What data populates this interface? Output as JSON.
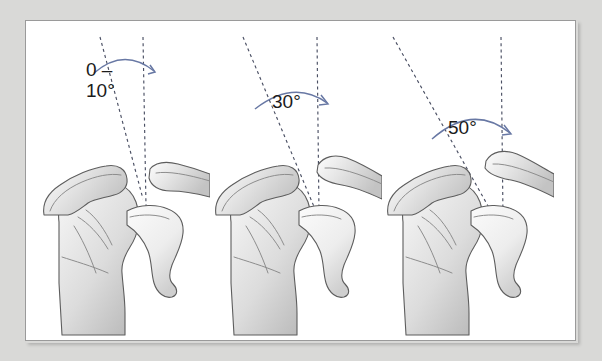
{
  "figure": {
    "panel_count": 3,
    "background_color": "#d9d9d7",
    "frame_color": "#9a9a9a",
    "arc_color": "#6878a4",
    "dashed_line_color": "#4a4f63",
    "bone_outline_color": "#5d5d5d",
    "bone_fill_color": "#e9e9e9"
  },
  "panels": [
    {
      "id": "panel-0",
      "angle_label": "0 –\n10°",
      "angle_value_min": 0,
      "angle_value_max": 10,
      "unit": "°",
      "anatomy": [
        "humerus",
        "scapula",
        "glenoid",
        "acromion",
        "clavicle",
        "coracoid"
      ]
    },
    {
      "id": "panel-1",
      "angle_label": "30°",
      "angle_value_min": 30,
      "angle_value_max": 30,
      "unit": "°",
      "anatomy": [
        "humerus",
        "scapula",
        "glenoid",
        "acromion",
        "clavicle",
        "coracoid"
      ]
    },
    {
      "id": "panel-2",
      "angle_label": "50°",
      "angle_value_min": 50,
      "angle_value_max": 50,
      "unit": "°",
      "anatomy": [
        "humerus",
        "scapula",
        "glenoid",
        "acromion",
        "clavicle",
        "coracoid"
      ]
    }
  ]
}
